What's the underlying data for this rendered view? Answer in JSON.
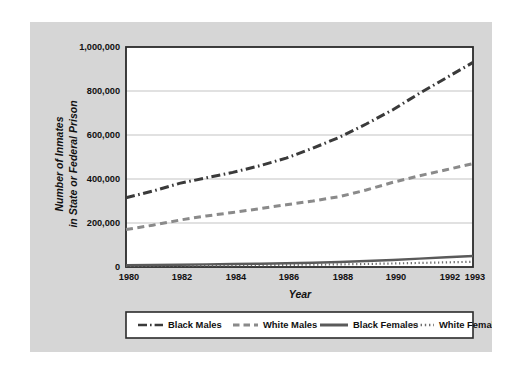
{
  "chart_data": {
    "type": "line",
    "title": "",
    "xlabel": "Year",
    "ylabel": "Number of Inmates in State or Federal Prison",
    "ylabel_line1": "Number of Inmates",
    "ylabel_line2": "in State or Federal Prison",
    "x": [
      1980,
      1981,
      1982,
      1983,
      1984,
      1985,
      1986,
      1987,
      1988,
      1989,
      1990,
      1991,
      1992,
      1993
    ],
    "xlim": [
      1980,
      1993
    ],
    "ylim": [
      0,
      1000000
    ],
    "xticks": [
      "1980",
      "1982",
      "1984",
      "1986",
      "1988",
      "1990",
      "1992",
      "1993"
    ],
    "xtick_values": [
      1980,
      1982,
      1984,
      1986,
      1988,
      1990,
      1992,
      1993
    ],
    "yticks": [
      "0",
      "200,000",
      "400,000",
      "600,000",
      "800,000",
      "1,000,000"
    ],
    "ytick_values": [
      0,
      200000,
      400000,
      600000,
      800000,
      1000000
    ],
    "grid": "horizontal",
    "legend_position": "bottom",
    "series": [
      {
        "name": "Black Males",
        "style": "dashdot",
        "color": "#3a3a3a",
        "values": [
          315000,
          345000,
          380000,
          405000,
          430000,
          460000,
          495000,
          540000,
          590000,
          650000,
          715000,
          790000,
          860000,
          930000
        ]
      },
      {
        "name": "White Males",
        "style": "dashed",
        "color": "#8a8a8a",
        "values": [
          170000,
          190000,
          213000,
          232000,
          248000,
          265000,
          283000,
          300000,
          320000,
          350000,
          385000,
          415000,
          442000,
          470000
        ]
      },
      {
        "name": "Black Females",
        "style": "solid",
        "color": "#5a5a5a",
        "values": [
          8000,
          9000,
          10500,
          12000,
          13500,
          15000,
          17000,
          19500,
          22500,
          27000,
          32000,
          38000,
          44000,
          50000
        ]
      },
      {
        "name": "White Females",
        "style": "dotted",
        "color": "#6e6e6e",
        "values": [
          5000,
          5600,
          6300,
          7000,
          7800,
          8600,
          9500,
          10600,
          12000,
          13800,
          16000,
          18500,
          21000,
          24000
        ]
      }
    ]
  },
  "legend": {
    "items": [
      {
        "label": "Black Males",
        "swatch": "dashdot-swatch"
      },
      {
        "label": "White Males",
        "swatch": "dashed-swatch"
      },
      {
        "label": "Black Females",
        "swatch": "solid-swatch"
      },
      {
        "label": "White Females",
        "swatch": "dotted-swatch"
      }
    ]
  },
  "colors": {
    "card_background": "#d6d6d6",
    "plot_background": "#ffffff",
    "frame": "#2b2b2b",
    "gridline": "#c3c3c3",
    "text": "#111111",
    "page_background": "#ffffff"
  }
}
